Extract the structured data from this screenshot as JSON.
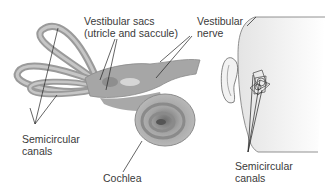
{
  "diagram": {
    "type": "anatomical illustration",
    "labels": {
      "vestibular_sacs_line1": "Vestibular sacs",
      "vestibular_sacs_line2": "(utricle and saccule)",
      "vestibular_nerve_line1": "Vestibular",
      "vestibular_nerve_line2": "nerve",
      "semicircular_left_line1": "Semicircular",
      "semicircular_left_line2": "canals",
      "cochlea": "Cochlea",
      "semicircular_right_line1": "Semicircular",
      "semicircular_right_line2": "canals"
    },
    "colors": {
      "structure_fill": "#a8a8a8",
      "structure_dark": "#7c7c7c",
      "head_fill": "#ececec",
      "line": "#222222",
      "text": "#3a3a3a"
    }
  }
}
